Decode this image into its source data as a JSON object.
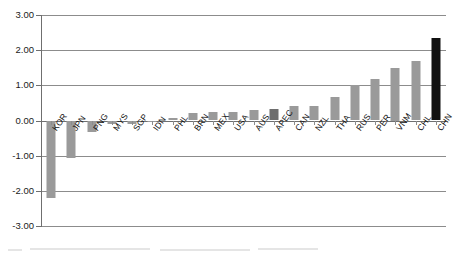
{
  "chart_data": {
    "type": "bar",
    "title": "",
    "xlabel": "",
    "ylabel": "",
    "ylim": [
      -3.0,
      3.0
    ],
    "grid": true,
    "legend": "none",
    "yticks": [
      "3.00",
      "2.00",
      "1.00",
      "0.00",
      "-1.00",
      "-2.00",
      "-3.00"
    ],
    "ytick_values": [
      3.0,
      2.0,
      1.0,
      0.0,
      -1.0,
      -2.0,
      -3.0
    ],
    "categories": [
      "KOR",
      "JPN",
      "PNG",
      "MYS",
      "SGP",
      "IDN",
      "PHL",
      "BRN",
      "MEX",
      "USA",
      "AUS",
      "APEC",
      "CAN",
      "NZL",
      "THA",
      "RUS",
      "PER",
      "VNM",
      "CHL",
      "CHN"
    ],
    "values": [
      -2.2,
      -1.07,
      -0.33,
      -0.1,
      -0.09,
      -0.03,
      0.07,
      0.21,
      0.24,
      0.25,
      0.29,
      0.32,
      0.41,
      0.4,
      0.68,
      1.0,
      1.19,
      1.5,
      1.7,
      2.34
    ],
    "bar_colors": [
      "#9a9a9a",
      "#9a9a9a",
      "#9a9a9a",
      "#9a9a9a",
      "#9a9a9a",
      "#9a9a9a",
      "#9a9a9a",
      "#9a9a9a",
      "#9a9a9a",
      "#9a9a9a",
      "#9a9a9a",
      "#6e6e6e",
      "#9a9a9a",
      "#9a9a9a",
      "#9a9a9a",
      "#9a9a9a",
      "#9a9a9a",
      "#9a9a9a",
      "#9a9a9a",
      "#111111"
    ],
    "accent_color": "#9a9a9a",
    "highlight_color": "#111111",
    "aggregate_color": "#6e6e6e",
    "grid_color": "#8c8c8c",
    "axis_color": "#6f6f6f"
  }
}
